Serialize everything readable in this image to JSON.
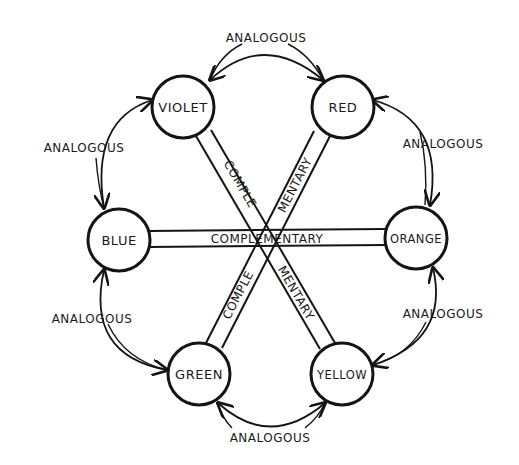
{
  "diagram": {
    "type": "color-wheel-relationships",
    "nodes": [
      {
        "id": "violet",
        "label": "VIOLET",
        "cx": 183,
        "cy": 107
      },
      {
        "id": "red",
        "label": "RED",
        "cx": 343,
        "cy": 107
      },
      {
        "id": "blue",
        "label": "BLUE",
        "cx": 119,
        "cy": 240
      },
      {
        "id": "orange",
        "label": "ORANGE",
        "cx": 416,
        "cy": 238
      },
      {
        "id": "green",
        "label": "GREEN",
        "cx": 199,
        "cy": 374
      },
      {
        "id": "yellow",
        "label": "YELLOW",
        "cx": 342,
        "cy": 374
      }
    ],
    "complementary_pairs": [
      {
        "from": "blue",
        "to": "orange",
        "label": "COMPLEMENTARY"
      },
      {
        "from": "violet",
        "to": "yellow",
        "label_upper": "COMPLE",
        "label_lower": "MENTARY"
      },
      {
        "from": "red",
        "to": "green",
        "label_upper": "MENTARY",
        "label_lower": "COMPLE"
      }
    ],
    "analogous_pairs": [
      {
        "from": "violet",
        "to": "red",
        "label": "ANALOGOUS"
      },
      {
        "from": "red",
        "to": "orange",
        "label": "ANALOGOUS"
      },
      {
        "from": "orange",
        "to": "yellow",
        "label": "ANALOGOUS"
      },
      {
        "from": "yellow",
        "to": "green",
        "label": "ANALOGOUS"
      },
      {
        "from": "green",
        "to": "blue",
        "label": "ANALOGOUS"
      },
      {
        "from": "blue",
        "to": "violet",
        "label": "ANALOGOUS"
      }
    ],
    "stroke_color": "#141414",
    "background": "#ffffff"
  }
}
